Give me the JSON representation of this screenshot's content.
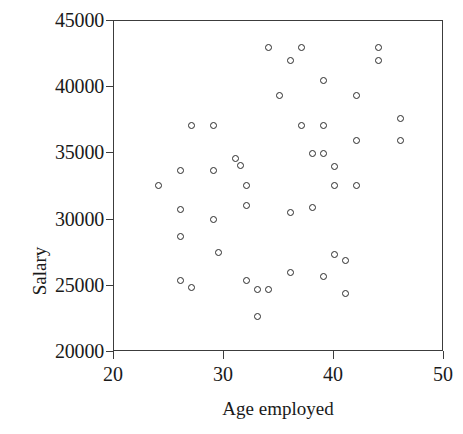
{
  "chart_data": {
    "type": "scatter",
    "title": "",
    "xlabel": "Age employed",
    "ylabel": "Salary",
    "xlim": [
      20,
      50
    ],
    "ylim": [
      20000,
      45000
    ],
    "xticks": [
      20,
      30,
      40,
      50
    ],
    "yticks": [
      20000,
      25000,
      30000,
      35000,
      40000,
      45000
    ],
    "xtick_labels": [
      "20",
      "30",
      "40",
      "50"
    ],
    "ytick_labels": [
      "20000",
      "25000",
      "30000",
      "35000",
      "40000",
      "45000"
    ],
    "grid": false,
    "legend": false,
    "marker": "open-circle",
    "marker_color": "#2b2b2b",
    "frame_color": "#3c3c3c",
    "background": "#ffffff",
    "n_points": 48,
    "points": [
      {
        "x": 24.0,
        "y": 32600
      },
      {
        "x": 26.0,
        "y": 33700
      },
      {
        "x": 26.0,
        "y": 30800
      },
      {
        "x": 26.0,
        "y": 28700
      },
      {
        "x": 26.0,
        "y": 25400
      },
      {
        "x": 27.0,
        "y": 37100
      },
      {
        "x": 27.0,
        "y": 24900
      },
      {
        "x": 29.0,
        "y": 33700
      },
      {
        "x": 29.0,
        "y": 30000
      },
      {
        "x": 29.0,
        "y": 37100
      },
      {
        "x": 29.5,
        "y": 27500
      },
      {
        "x": 31.0,
        "y": 34600
      },
      {
        "x": 31.5,
        "y": 34100
      },
      {
        "x": 32.0,
        "y": 32600
      },
      {
        "x": 32.0,
        "y": 31100
      },
      {
        "x": 32.0,
        "y": 25400
      },
      {
        "x": 33.0,
        "y": 24700
      },
      {
        "x": 33.0,
        "y": 22700
      },
      {
        "x": 34.0,
        "y": 24700
      },
      {
        "x": 34.0,
        "y": 43000
      },
      {
        "x": 35.0,
        "y": 39400
      },
      {
        "x": 36.0,
        "y": 42000
      },
      {
        "x": 36.0,
        "y": 30500
      },
      {
        "x": 36.0,
        "y": 26000
      },
      {
        "x": 37.0,
        "y": 43000
      },
      {
        "x": 37.0,
        "y": 37100
      },
      {
        "x": 38.0,
        "y": 35000
      },
      {
        "x": 38.0,
        "y": 30900
      },
      {
        "x": 39.0,
        "y": 40500
      },
      {
        "x": 39.0,
        "y": 37100
      },
      {
        "x": 39.0,
        "y": 35000
      },
      {
        "x": 39.0,
        "y": 25700
      },
      {
        "x": 40.0,
        "y": 34000
      },
      {
        "x": 40.0,
        "y": 32600
      },
      {
        "x": 40.0,
        "y": 27400
      },
      {
        "x": 41.0,
        "y": 26900
      },
      {
        "x": 41.0,
        "y": 24400
      },
      {
        "x": 42.0,
        "y": 39400
      },
      {
        "x": 42.0,
        "y": 36000
      },
      {
        "x": 42.0,
        "y": 32600
      },
      {
        "x": 44.0,
        "y": 43000
      },
      {
        "x": 44.0,
        "y": 42000
      },
      {
        "x": 46.0,
        "y": 37600
      },
      {
        "x": 46.0,
        "y": 36000
      }
    ]
  },
  "axes": {
    "y_title": "Salary",
    "x_title": "Age employed"
  }
}
